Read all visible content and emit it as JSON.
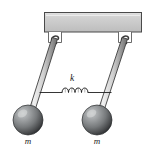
{
  "figure": {
    "background_color": "#ffffff",
    "width": 146,
    "height": 149
  },
  "ceiling": {
    "name": "support-bar",
    "fill_color": "#c9c9c9",
    "top_highlight_color": "#dedede",
    "border_color": "#4d4d4d",
    "x": 44,
    "y": 12,
    "width": 98,
    "height": 20
  },
  "pivots": [
    {
      "id": "left-pivot",
      "label": "",
      "cx": 54,
      "cy": 38,
      "color": "#555555"
    },
    {
      "id": "right-pivot",
      "label": "",
      "cx": 124,
      "cy": 38,
      "color": "#555555"
    }
  ],
  "rods": [
    {
      "id": "left-rod",
      "top_x": 54,
      "top_y": 40,
      "bottom_x": 29,
      "bottom_y": 117,
      "fill_color": "#d5d5d5",
      "edge_color": "#3c3c3c",
      "width": 3.4
    },
    {
      "id": "right-rod",
      "top_x": 124,
      "top_y": 40,
      "bottom_x": 98,
      "bottom_y": 117,
      "fill_color": "#d5d5d5",
      "edge_color": "#3c3c3c",
      "width": 3.4
    }
  ],
  "bobs": [
    {
      "id": "left-bob",
      "label": "m",
      "cx": 28,
      "cy": 120,
      "r": 15,
      "highlight_color": "#b9bcbd",
      "mid_color": "#77797b",
      "shadow_color": "#303234",
      "label_x": 28,
      "label_y": 144
    },
    {
      "id": "right-bob",
      "label": "m",
      "cx": 97,
      "cy": 120,
      "r": 15,
      "highlight_color": "#b9bcbd",
      "mid_color": "#77797b",
      "shadow_color": "#303234",
      "label_x": 97,
      "label_y": 144
    }
  ],
  "spring": {
    "id": "coupling-spring",
    "label": "k",
    "label_x": 72,
    "label_y": 81,
    "left_anchor_x": 39,
    "right_anchor_x": 112,
    "y": 92,
    "coils": 4,
    "coil_start_x": 62,
    "coil_end_x": 88,
    "coil_amplitude": 5,
    "stroke_color": "#1f1f1f",
    "stroke_width": 0.9
  }
}
